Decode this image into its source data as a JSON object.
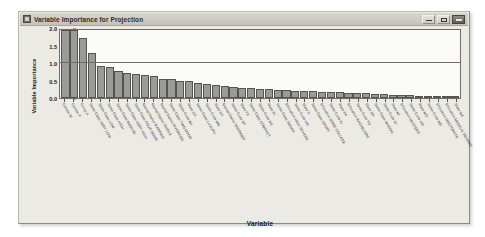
{
  "window": {
    "title": "Variable Importance for Projection",
    "icon": "app-window-icon",
    "controls": {
      "minimize": "Minimize",
      "maximize": "Maximize",
      "close": "Close"
    },
    "colors": {
      "frame": "#ece9e2",
      "titlebar": "#cfccc3",
      "plot_background": "#fbfbfa",
      "bar_fill": "#9a9a96",
      "bar_outline": "#54534f",
      "axis": "#6f6d68"
    }
  },
  "chart_data": {
    "type": "bar",
    "title": "Variable Importance for Projection",
    "xlabel": "Variable",
    "ylabel": "Variable Importance",
    "ylim": [
      0.0,
      2.0
    ],
    "yticks": [
      "0.0",
      "0.5",
      "1.0",
      "1.5",
      "2.0"
    ],
    "ytick_values": [
      0.0,
      0.5,
      1.0,
      1.5,
      2.0
    ],
    "grid": true,
    "gridlines_at": [
      1.0
    ],
    "legend": null,
    "categories": [
      "Gender M",
      "Gender F",
      "Group A",
      "Sales Class VERY LOW",
      "Sales Class LOW",
      "Sales Class HIGH",
      "Sales Class MEDIUM",
      "Sales Class VERY HIGH",
      "Sales Class FOUR DOOR",
      "Marital Status MARRIED",
      "Marital Status SINGLE",
      "Marital Status DIVORCED",
      "Sales Class TWO DOOR",
      "Sales Code BA",
      "State CA",
      "Sales Class LUXURY",
      "Sales Code MM",
      "State NY",
      "Marital Status WIDOWED",
      "Sales Code SP",
      "State TX",
      "Sales Class COMPACT",
      "Sales Code DS",
      "State FL",
      "Sales Class SEDAN",
      "Education HIGH SCHOOL",
      "Sales Code HD",
      "State IL",
      "Sales Class SPORT",
      "Education SOME COLLEGE",
      "Sales Code KI",
      "State PA",
      "Education BACHELORS",
      "Sales Code TO",
      "State OH",
      "Sales Class WAGON",
      "Sales Code NI",
      "State MI",
      "Education MASTERS",
      "Sales Code HO",
      "State MO",
      "Sales Code MD",
      "Education DOCTORATE",
      "Education MEDICAL DEGREE",
      "State WA"
    ],
    "values": [
      1.95,
      1.95,
      1.72,
      1.28,
      0.92,
      0.88,
      0.78,
      0.72,
      0.7,
      0.65,
      0.62,
      0.55,
      0.53,
      0.5,
      0.48,
      0.42,
      0.4,
      0.38,
      0.34,
      0.32,
      0.3,
      0.29,
      0.27,
      0.25,
      0.24,
      0.22,
      0.21,
      0.2,
      0.19,
      0.18,
      0.17,
      0.16,
      0.15,
      0.14,
      0.13,
      0.12,
      0.11,
      0.1,
      0.09,
      0.08,
      0.07,
      0.06,
      0.05,
      0.04,
      0.03
    ]
  }
}
